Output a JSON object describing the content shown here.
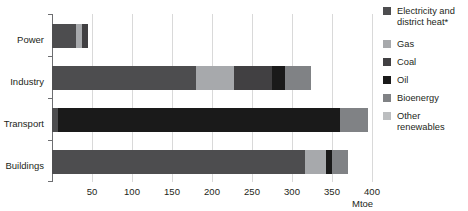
{
  "chart_data": {
    "type": "bar",
    "orientation": "horizontal",
    "stacked": true,
    "title": "",
    "xlabel": "Mtoe",
    "ylabel": "",
    "xlim": [
      0,
      400
    ],
    "xticks": [
      50,
      100,
      150,
      200,
      250,
      300,
      350,
      400
    ],
    "grid": true,
    "legend_position": "right",
    "categories": [
      "Power",
      "Industry",
      "Transport",
      "Buildings"
    ],
    "series": [
      {
        "name": "Electricity and district heat*",
        "color": "#4d4d4f",
        "values": [
          30,
          180,
          8,
          316
        ]
      },
      {
        "name": "Gas",
        "color": "#a7a9ac",
        "values": [
          7,
          48,
          0,
          27
        ]
      },
      {
        "name": "Coal",
        "color": "#414042",
        "values": [
          8,
          47,
          0,
          0
        ]
      },
      {
        "name": "Oil",
        "color": "#1a1a1a",
        "values": [
          0,
          16,
          352,
          7
        ]
      },
      {
        "name": "Bioenergy",
        "color": "#808285",
        "values": [
          0,
          33,
          35,
          20
        ]
      },
      {
        "name": "Other renewables",
        "color": "#bcbec0",
        "values": [
          0,
          0,
          0,
          0
        ]
      }
    ],
    "totals": [
      45,
      324,
      395,
      370
    ]
  },
  "legend": {
    "items": [
      {
        "label": "Electricity and district heat*",
        "color": "#4d4d4f"
      },
      {
        "label": "Gas",
        "color": "#a7a9ac"
      },
      {
        "label": "Coal",
        "color": "#414042"
      },
      {
        "label": "Oil",
        "color": "#1a1a1a"
      },
      {
        "label": "Bioenergy",
        "color": "#808285"
      },
      {
        "label": "Other renewables",
        "color": "#bcbec0"
      }
    ]
  },
  "axis": {
    "unit_label": "Mtoe",
    "tick_labels": [
      "50",
      "100",
      "150",
      "200",
      "250",
      "300",
      "350",
      "400"
    ]
  }
}
